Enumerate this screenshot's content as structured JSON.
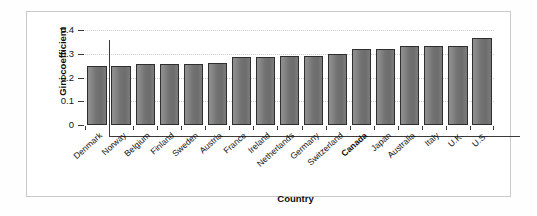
{
  "chart_data": {
    "type": "bar",
    "title": "",
    "xlabel": "Country",
    "ylabel": "Gini coefficient",
    "ylim": [
      0,
      0.4
    ],
    "ytick_labels": [
      "0",
      "0.1",
      "0.2",
      "0.3",
      "0.4"
    ],
    "ytick_values": [
      0,
      0.1,
      0.2,
      0.3,
      0.4
    ],
    "grid": "horizontal-dotted",
    "legend": "none",
    "highlight_category": "Canada",
    "categories": [
      "Denmark",
      "Norway",
      "Belgium",
      "Finland",
      "Sweden",
      "Austria",
      "France",
      "Ireland",
      "Netherlands",
      "Germany",
      "Switzerland",
      "Canada",
      "Japan",
      "Australia",
      "Italy",
      "U.K.",
      "U.S."
    ],
    "values": [
      0.247,
      0.248,
      0.257,
      0.257,
      0.257,
      0.26,
      0.288,
      0.288,
      0.291,
      0.292,
      0.3,
      0.318,
      0.322,
      0.331,
      0.331,
      0.334,
      0.368
    ],
    "bold_categories": [
      "Canada"
    ]
  },
  "colors": {
    "bar_fill_light": "#8e8e8e",
    "bar_fill_dark": "#6d6d6d",
    "bar_outline": "#2e2e2e",
    "axis": "#3a3a3a",
    "gridline": "#cfcfcf",
    "frame_border": "#c9c9c9",
    "background": "#ffffff",
    "text": "#111111"
  }
}
